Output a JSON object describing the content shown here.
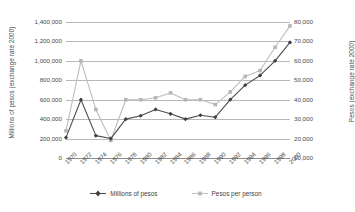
{
  "chart_data": {
    "type": "line",
    "title": "",
    "xlabel": "",
    "grid": true,
    "legend_position": "bottom",
    "x": [
      1970,
      1972,
      1974,
      1976,
      1978,
      1980,
      1982,
      1984,
      1986,
      1988,
      1990,
      1992,
      1994,
      1996,
      1998,
      2000
    ],
    "x_tick_labels": [
      "1970",
      "1972",
      "1974",
      "1976",
      "1978",
      "1980",
      "1982",
      "1984",
      "1986",
      "1988",
      "1990",
      "1992",
      "1994",
      "1996",
      "1998",
      "2000"
    ],
    "axes": {
      "left": {
        "label": "Millions of  pesos (exchange rate 2000)",
        "ylim": [
          0,
          1400000
        ],
        "ticks": [
          0,
          200000,
          400000,
          600000,
          800000,
          1000000,
          1200000,
          1400000
        ],
        "tick_labels": [
          "0",
          "200,000",
          "400,000",
          "600,000",
          "800,000",
          "1,000,000",
          "1,200,000",
          "1,400,000"
        ]
      },
      "right": {
        "label": "Pesos (exchange rate 2000)",
        "ylim": [
          10000,
          80000
        ],
        "ticks": [
          10000,
          20000,
          30000,
          40000,
          50000,
          60000,
          70000,
          80000
        ],
        "tick_labels": [
          "10,000",
          "20,000",
          "30,000",
          "40,000",
          "50,000",
          "60,000",
          "70,000",
          "80,000"
        ]
      }
    },
    "series": [
      {
        "name": "Millions of pesos",
        "axis": "left",
        "color": "#4d4d4d",
        "marker": "diamond",
        "values": [
          210000,
          600000,
          230000,
          200000,
          400000,
          435000,
          500000,
          455000,
          400000,
          440000,
          420000,
          600000,
          750000,
          850000,
          1000000,
          1190000
        ]
      },
      {
        "name": "Pesos per person",
        "axis": "right",
        "color": "#bdbdbd",
        "marker": "square",
        "values": [
          24000,
          60000,
          35000,
          19000,
          40000,
          40000,
          41000,
          43500,
          40000,
          40000,
          37500,
          44000,
          52000,
          55000,
          67000,
          78000
        ]
      }
    ]
  },
  "legend": {
    "items": [
      {
        "label": "Millions of pesos"
      },
      {
        "label": "Pesos per person"
      }
    ]
  }
}
